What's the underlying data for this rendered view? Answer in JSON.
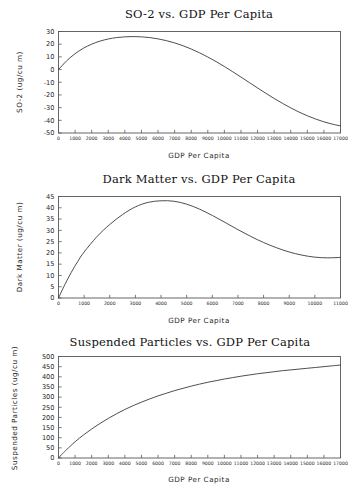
{
  "page": {
    "background_color": "#ffffff",
    "line_color": "#3a3a3a",
    "frame_color": "#555555",
    "text_color": "#1a1a1a"
  },
  "charts": [
    {
      "id": "so2",
      "title": "SO-2 vs. GDP Per Capita",
      "xlabel": "GDP Per Capita",
      "ylabel": "SO-2 (ug/cu m)"
    },
    {
      "id": "dark-matter",
      "title": "Dark Matter vs. GDP Per Capita",
      "xlabel": "GDP Per Capita",
      "ylabel": "Dark Matter (ug/cu m)"
    },
    {
      "id": "suspended-particles",
      "title": "Suspended Particles vs. GDP Per Capita",
      "xlabel": "GDP Per Capita",
      "ylabel": "Suspended Particles (ug/cu m)"
    }
  ],
  "chart_data": [
    {
      "type": "line",
      "title": "SO-2 vs. GDP Per Capita",
      "xlabel": "GDP Per Capita",
      "ylabel": "SO-2 (ug/cu m)",
      "xlim": [
        0,
        17000
      ],
      "ylim": [
        -50,
        30
      ],
      "xticks": [
        0,
        1000,
        2000,
        3000,
        4000,
        5000,
        6000,
        7000,
        8000,
        9000,
        10000,
        11000,
        12000,
        13000,
        14000,
        15000,
        16000,
        17000
      ],
      "xtick_labels": [
        "0",
        "1000",
        "2000",
        "3000",
        "4000",
        "5000",
        "6000",
        "7000",
        "8000",
        "9000",
        "10000",
        "11000",
        "12000",
        "13000",
        "14000",
        "15000",
        "16000",
        "17000"
      ],
      "yticks": [
        -50,
        -40,
        -30,
        -20,
        -10,
        0,
        10,
        20,
        30
      ],
      "ytick_labels": [
        "-50",
        "-40",
        "-30",
        "-20",
        "-10",
        "0",
        "10",
        "20",
        "30"
      ],
      "grid": false,
      "legend": false,
      "series": [
        {
          "name": "SO-2",
          "x": [
            0,
            500,
            1000,
            1500,
            2000,
            2500,
            3000,
            3500,
            4000,
            4500,
            5000,
            5500,
            6000,
            6500,
            7000,
            7500,
            8000,
            8500,
            9000,
            9500,
            10000,
            10500,
            11000,
            11500,
            12000,
            12500,
            13000,
            13500,
            14000,
            14500,
            15000,
            15500,
            16000,
            16500,
            17000
          ],
          "y": [
            0.0,
            7.0,
            12.5,
            16.8,
            20.0,
            22.4,
            24.1,
            25.2,
            25.8,
            26.0,
            25.8,
            25.2,
            24.2,
            22.8,
            21.0,
            18.8,
            16.2,
            13.2,
            9.9,
            6.3,
            2.4,
            -1.7,
            -5.9,
            -10.2,
            -14.5,
            -18.7,
            -22.8,
            -26.6,
            -30.2,
            -33.5,
            -36.4,
            -39.0,
            -41.2,
            -43.0,
            -44.4
          ]
        }
      ]
    },
    {
      "type": "line",
      "title": "Dark Matter vs. GDP Per Capita",
      "xlabel": "GDP Per Capita",
      "ylabel": "Dark Matter (ug/cu m)",
      "xlim": [
        0,
        11000
      ],
      "ylim": [
        0,
        45
      ],
      "xticks": [
        0,
        1000,
        2000,
        3000,
        4000,
        5000,
        6000,
        7000,
        8000,
        9000,
        10000,
        11000
      ],
      "xtick_labels": [
        "0",
        "1000",
        "2000",
        "3000",
        "4000",
        "5000",
        "6000",
        "7000",
        "8000",
        "9000",
        "10000",
        "11000"
      ],
      "yticks": [
        0,
        5,
        10,
        15,
        20,
        25,
        30,
        35,
        40,
        45
      ],
      "ytick_labels": [
        "0",
        "5",
        "10",
        "15",
        "20",
        "25",
        "30",
        "35",
        "40",
        "45"
      ],
      "grid": false,
      "legend": false,
      "series": [
        {
          "name": "Dark Matter",
          "x": [
            0,
            250,
            500,
            750,
            1000,
            1500,
            2000,
            2500,
            3000,
            3500,
            4000,
            4500,
            5000,
            5500,
            6000,
            6500,
            7000,
            7500,
            8000,
            8500,
            9000,
            9500,
            10000,
            10500,
            11000
          ],
          "y": [
            0.0,
            6.0,
            11.4,
            16.2,
            20.4,
            27.2,
            32.6,
            37.0,
            40.4,
            42.4,
            43.1,
            42.9,
            41.6,
            39.4,
            36.6,
            33.5,
            30.3,
            27.3,
            24.6,
            22.3,
            20.4,
            19.0,
            18.1,
            17.8,
            18.0
          ]
        }
      ]
    },
    {
      "type": "line",
      "title": "Suspended Particles vs. GDP Per Capita",
      "xlabel": "GDP Per Capita",
      "ylabel": "Suspended Particles (ug/cu m)",
      "xlim": [
        0,
        17000
      ],
      "ylim": [
        0,
        500
      ],
      "xticks": [
        0,
        1000,
        2000,
        3000,
        4000,
        5000,
        6000,
        7000,
        8000,
        9000,
        10000,
        11000,
        12000,
        13000,
        14000,
        15000,
        16000,
        17000
      ],
      "xtick_labels": [
        "0",
        "1000",
        "2000",
        "3000",
        "4000",
        "5000",
        "6000",
        "7000",
        "8000",
        "9000",
        "10000",
        "11000",
        "12000",
        "13000",
        "14000",
        "15000",
        "16000",
        "17000"
      ],
      "yticks": [
        0,
        50,
        100,
        150,
        200,
        250,
        300,
        350,
        400,
        450,
        500
      ],
      "ytick_labels": [
        "0",
        "50",
        "100",
        "150",
        "200",
        "250",
        "300",
        "350",
        "400",
        "450",
        "500"
      ],
      "grid": false,
      "legend": false,
      "series": [
        {
          "name": "Suspended Particles",
          "x": [
            0,
            250,
            500,
            1000,
            1500,
            2000,
            2500,
            3000,
            3500,
            4000,
            4500,
            5000,
            5500,
            6000,
            6500,
            7000,
            7500,
            8000,
            8500,
            9000,
            9500,
            10000,
            10500,
            11000,
            11500,
            12000,
            12500,
            13000,
            13500,
            14000,
            14500,
            15000,
            15500,
            16000,
            16500,
            17000
          ],
          "y": [
            0,
            22,
            42,
            80,
            113,
            143,
            170,
            195,
            218,
            239,
            258,
            275,
            291,
            306,
            319,
            332,
            343,
            354,
            364,
            373,
            381,
            389,
            396,
            403,
            409,
            415,
            420,
            425,
            430,
            434,
            438,
            442,
            446,
            450,
            454,
            458
          ]
        }
      ]
    }
  ]
}
